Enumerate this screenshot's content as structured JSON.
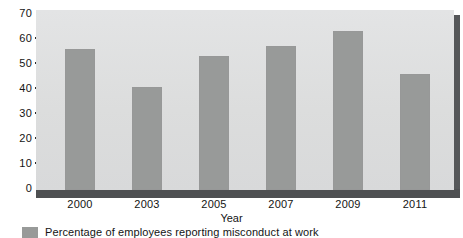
{
  "chart_data": {
    "type": "bar",
    "title": "",
    "subtitle": "",
    "categories": [
      "2000",
      "2003",
      "2005",
      "2007",
      "2009",
      "2011"
    ],
    "values": [
      55,
      40,
      52,
      56,
      62,
      45
    ],
    "series": [
      {
        "name": "Percentage of employees reporting misconduct at work",
        "values": [
          55,
          40,
          52,
          56,
          62,
          45
        ]
      }
    ],
    "xlabel": "Year",
    "ylabel": "",
    "ylim": [
      0,
      70
    ],
    "yticks": [
      0,
      10,
      20,
      30,
      40,
      50,
      60,
      70
    ],
    "ytick_labels": [
      "0",
      "10",
      "20",
      "30",
      "40",
      "50",
      "60",
      "70"
    ],
    "grid": false,
    "legend_position": "bottom-left",
    "bar_color": "#989a99",
    "plot_background": "#dedfe0",
    "page_background": "#ffffff"
  },
  "axis": {
    "y_labels": [
      "70",
      "60",
      "50",
      "40",
      "30",
      "20",
      "10",
      "0"
    ],
    "x_labels": [
      "2000",
      "2003",
      "2005",
      "2007",
      "2009",
      "2011"
    ],
    "x_title": "Year"
  },
  "legend": {
    "entries": [
      {
        "label": "Percentage of employees reporting misconduct at work",
        "color": "#989a99"
      }
    ]
  }
}
